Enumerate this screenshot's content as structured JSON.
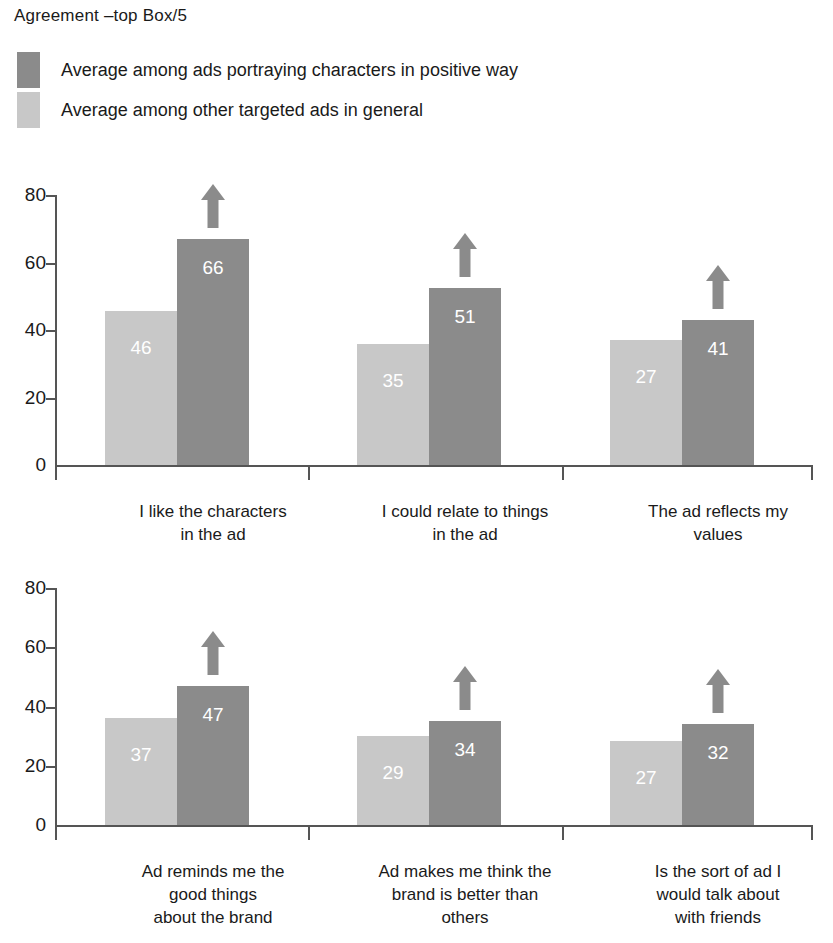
{
  "title": "Agreement –top Box/5",
  "legend": {
    "position": "top-left",
    "items": [
      {
        "label": "Average among ads portraying characters in positive way",
        "color": "#8b8b8b",
        "key": "positive"
      },
      {
        "label": "Average among other targeted ads in general",
        "color": "#c8c8c8",
        "key": "general"
      }
    ]
  },
  "colors": {
    "series_positive": "#8b8b8b",
    "series_general": "#c8c8c8",
    "axis": "#555555",
    "value_label": "#ffffff",
    "text": "#1a1a1a"
  },
  "annotations": {
    "arrow_icon": "up-arrow-icon",
    "arrow_meaning": "significantly higher"
  },
  "chart_data": [
    {
      "type": "bar",
      "title": "Agreement –top Box/5",
      "panel": "top",
      "xlabel": "",
      "ylabel": "",
      "ylim": [
        0,
        80
      ],
      "yticks": [
        0,
        20,
        40,
        60,
        80
      ],
      "grid": false,
      "legend_position": "top-left",
      "categories": [
        "I like the characters\nin the ad",
        "I could relate to things\nin the ad",
        "The ad reflects my\nvalues"
      ],
      "series": [
        {
          "name": "Average among other targeted ads in general",
          "key": "general",
          "color": "#c8c8c8",
          "values": [
            46,
            35,
            27
          ],
          "plotted_heights": [
            45.5,
            36,
            37
          ]
        },
        {
          "name": "Average among ads portraying characters in positive way",
          "key": "positive",
          "color": "#8b8b8b",
          "values": [
            66,
            51,
            41
          ],
          "plotted_heights": [
            67,
            52.5,
            43
          ],
          "arrow_up": [
            true,
            true,
            true
          ]
        }
      ]
    },
    {
      "type": "bar",
      "panel": "bottom",
      "xlabel": "",
      "ylabel": "",
      "ylim": [
        0,
        80
      ],
      "yticks": [
        0,
        20,
        40,
        60,
        80
      ],
      "grid": false,
      "categories": [
        "Ad reminds me the\ngood things\nabout the brand",
        "Ad makes me think the\nbrand is better than\nothers",
        "Is the sort of ad I\nwould talk about\nwith friends"
      ],
      "series": [
        {
          "name": "Average among other targeted ads in general",
          "key": "general",
          "color": "#c8c8c8",
          "values": [
            37,
            29,
            27
          ],
          "plotted_heights": [
            36,
            30,
            28.5
          ]
        },
        {
          "name": "Average among ads portraying characters in positive way",
          "key": "positive",
          "color": "#8b8b8b",
          "values": [
            47,
            34,
            32
          ],
          "plotted_heights": [
            47,
            35,
            34
          ],
          "arrow_up": [
            true,
            true,
            true
          ]
        }
      ]
    }
  ]
}
